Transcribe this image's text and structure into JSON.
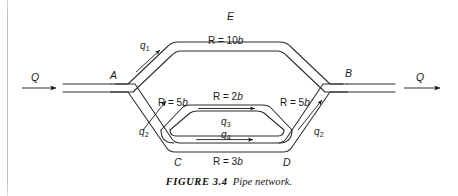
{
  "figure": {
    "caption_label": "FIGURE 3.4",
    "caption_text": "Pipe network.",
    "type": "pipe-network-diagram"
  },
  "nodes": [
    {
      "id": "A",
      "label": "A"
    },
    {
      "id": "B",
      "label": "B"
    },
    {
      "id": "C",
      "label": "C"
    },
    {
      "id": "D",
      "label": "D"
    },
    {
      "id": "E",
      "label": "E"
    }
  ],
  "inlet": {
    "label": "Q",
    "direction": "right"
  },
  "outlet": {
    "label": "Q",
    "direction": "right"
  },
  "resistances": [
    {
      "id": "AEB",
      "text": "R = 10b",
      "prefix": "R = 10",
      "sym": "b"
    },
    {
      "id": "AC",
      "text": "R = 5b",
      "prefix": "R = 5",
      "sym": "b"
    },
    {
      "id": "DB",
      "text": "R = 5b",
      "prefix": "R = 5",
      "sym": "b"
    },
    {
      "id": "CD_inner",
      "text": "R = 2b",
      "prefix": "R = 2",
      "sym": "b"
    },
    {
      "id": "CD_outer",
      "text": "R = 3b",
      "prefix": "R = 3",
      "sym": "b"
    }
  ],
  "flows": [
    {
      "id": "q1",
      "base": "q",
      "sub": "1",
      "branch": "A-E"
    },
    {
      "id": "q2_left",
      "base": "q",
      "sub": "2",
      "branch": "C-A"
    },
    {
      "id": "q2_right",
      "base": "q",
      "sub": "2",
      "branch": "D-B"
    },
    {
      "id": "q3",
      "base": "q",
      "sub": "3",
      "branch": "C-D inner R=2b"
    },
    {
      "id": "q4",
      "base": "q",
      "sub": "4",
      "branch": "C-D outer R=3b"
    }
  ],
  "colors": {
    "ink": "#1a1a1a",
    "pipe": "#2b2b2b",
    "paper": "#ffffff",
    "page_edge": "#bdbdbd"
  }
}
